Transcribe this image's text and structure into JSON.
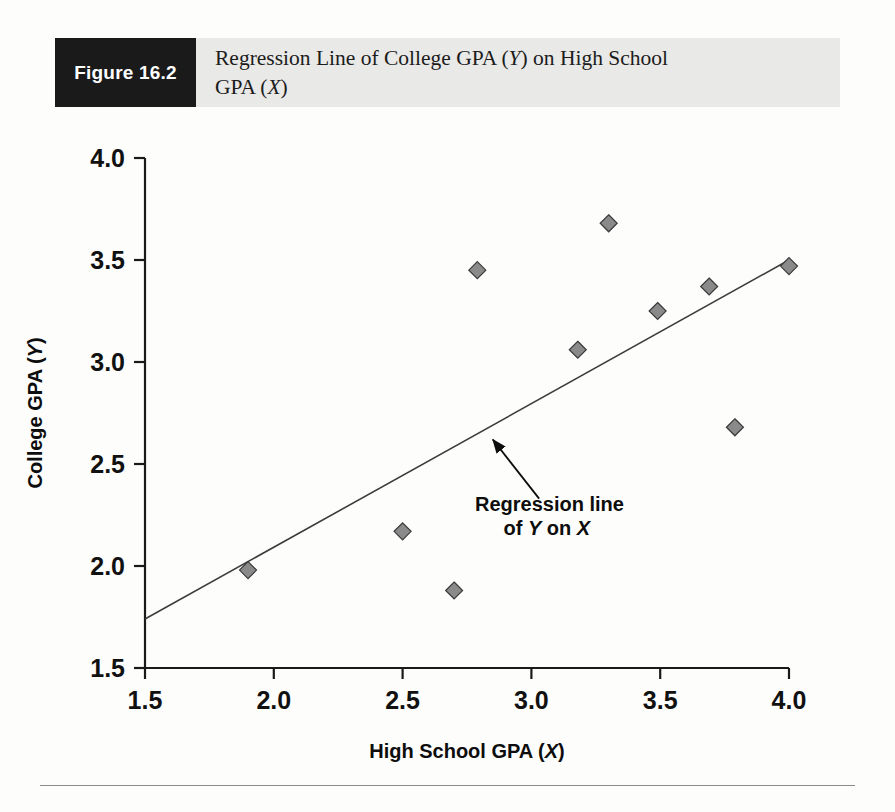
{
  "figure": {
    "tag_label": "Figure 16.2",
    "caption_line1": "Regression Line of College GPA (Y) on High School",
    "caption_line2": "GPA (X)",
    "caption_full": "Regression Line of College GPA (Y) on High School GPA (X)",
    "tag_background": "#1a1a1a",
    "band_background": "#e9e9e7"
  },
  "chart_data": {
    "type": "scatter",
    "title": "Regression Line of College GPA (Y) on High School GPA (X)",
    "xlabel": "High School GPA (X)",
    "ylabel": "College GPA (Y)",
    "xlim": [
      1.5,
      4.0
    ],
    "ylim": [
      1.5,
      4.0
    ],
    "xticks": [
      "1.5",
      "2.0",
      "2.5",
      "3.0",
      "3.5",
      "4.0"
    ],
    "yticks": [
      "4.0",
      "3.5",
      "3.0",
      "2.5",
      "2.0",
      "1.5"
    ],
    "xtick_values": [
      1.5,
      2.0,
      2.5,
      3.0,
      3.5,
      4.0
    ],
    "ytick_values": [
      1.5,
      2.0,
      2.5,
      3.0,
      3.5,
      4.0
    ],
    "grid": false,
    "legend": false,
    "marker": {
      "shape": "diamond",
      "fill": "#8a8a8a",
      "edge": "#3a3a3a",
      "size": 17
    },
    "points": [
      {
        "x": 1.9,
        "y": 1.98
      },
      {
        "x": 2.5,
        "y": 2.17
      },
      {
        "x": 2.7,
        "y": 1.88
      },
      {
        "x": 2.79,
        "y": 3.45
      },
      {
        "x": 3.18,
        "y": 3.06
      },
      {
        "x": 3.3,
        "y": 3.68
      },
      {
        "x": 3.49,
        "y": 3.25
      },
      {
        "x": 3.69,
        "y": 3.37
      },
      {
        "x": 3.79,
        "y": 2.68
      },
      {
        "x": 4.0,
        "y": 3.47
      }
    ],
    "regression_line": {
      "x_start": 1.5,
      "y_start": 1.74,
      "x_end": 4.0,
      "y_end": 3.5,
      "color": "#3c3c3c",
      "width": 1.6
    },
    "annotations": [
      {
        "name": "regression-line-callout",
        "line1": "Regression line",
        "line2_prefix": "of ",
        "line2_y": "Y",
        "line2_mid": " on ",
        "line2_x": "X",
        "line2": "of Y on X",
        "arrow_from_x": 3.03,
        "arrow_from_y": 2.33,
        "arrow_to_x": 2.85,
        "arrow_to_y": 2.62
      }
    ]
  },
  "axes": {
    "axis_color": "#1a1a1a",
    "plot_background": "#fdfdfc"
  }
}
